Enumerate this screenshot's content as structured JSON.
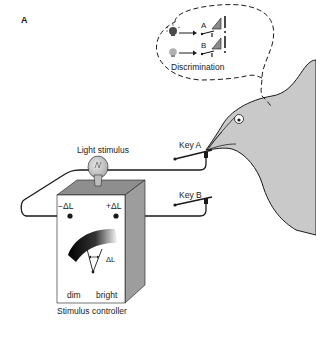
{
  "figure": {
    "panel_label": "A",
    "thought_bubble": {
      "caption": "Discrimination",
      "rows": [
        {
          "key": "A",
          "light": "bright",
          "reward": "!"
        },
        {
          "key": "B",
          "light": "dim",
          "reward": "!"
        }
      ]
    },
    "labels": {
      "light_stimulus": "Light stimulus",
      "key_a": "Key A",
      "key_b": "Key B",
      "minus_delta": "−ΔL",
      "plus_delta": "+ΔL",
      "delta_l": "ΔL",
      "dim": "dim",
      "bright": "bright",
      "controller": "Stimulus controller"
    },
    "colors": {
      "line": "#1a1a1a",
      "pigeon_fill": "#c9c9c9",
      "box_front": "#ffffff",
      "box_top": "#8e8e8e",
      "box_side": "#9d9d9d",
      "bulb": "#c8c8c8"
    }
  }
}
